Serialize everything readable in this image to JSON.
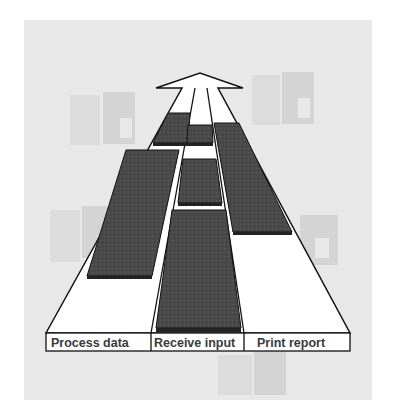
{
  "diagram": {
    "type": "roadmap-arrow",
    "lanes": [
      {
        "label": "Process data"
      },
      {
        "label": "Receive input"
      },
      {
        "label": "Print report"
      }
    ],
    "colors": {
      "background": "#e8e8e8",
      "road": "#ffffff",
      "block": "#4a4a4a",
      "outline": "#111111",
      "label_text": "#3a3a3a"
    },
    "background_icons": [
      "window-logo-icon",
      "window-logo-icon",
      "window-logo-icon",
      "window-logo-icon",
      "window-logo-icon"
    ]
  }
}
